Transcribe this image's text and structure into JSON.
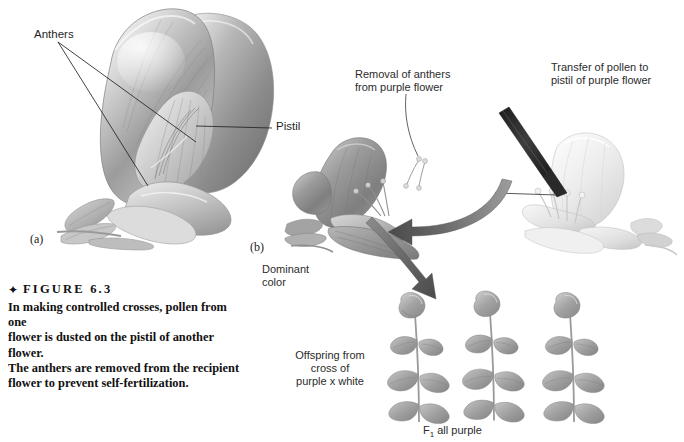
{
  "figure": {
    "marker": "✦",
    "head": "FIGURE 6.3",
    "caption": "In making controlled crosses, pollen from one\nflower is dusted on the pistil of another flower.\nThe anthers are removed from the recipient\nflower to prevent self-fertilization."
  },
  "panels": {
    "a_letter": "(a)",
    "b_letter": "(b)"
  },
  "labels": {
    "anthers": "Anthers",
    "pistil": "Pistil",
    "removal": "Removal of anthers\nfrom purple flower",
    "transfer": "Transfer of pollen to\npistil of purple flower",
    "dominant": "Dominant\ncolor",
    "offspring": "Offspring from\ncross of\npurple x white",
    "f1_prefix": "F",
    "f1_sub": "1",
    "f1_suffix": " all purple"
  },
  "colors": {
    "background": "#ffffff",
    "text": "#1f1f1f",
    "line": "#2a2a2a",
    "arrow": "#5a5a5a",
    "purple_flower_dark": "#8e8e8e",
    "purple_flower_mid": "#a9a9a9",
    "white_flower": "#e9e9e9",
    "white_flower_shade": "#cfcfcf",
    "plant_green": "#9a9a9a",
    "brush_dark": "#3c3c3c"
  },
  "illustrations": {
    "main_flower": "pea-flower-cutaway-grayscale",
    "purple_flower": "purple-pea-flower-anthers-removed",
    "white_flower": "white-pea-flower-with-brush",
    "offspring_plants": [
      "plant-1",
      "plant-2",
      "plant-3"
    ],
    "brush": "pollen-brush"
  }
}
